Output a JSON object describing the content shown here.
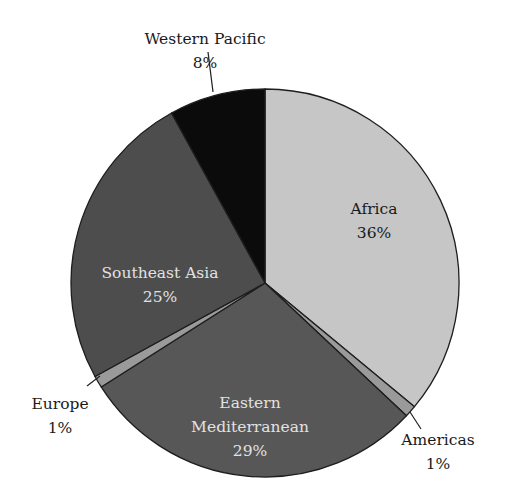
{
  "chart_data": {
    "type": "pie",
    "title": "",
    "start_angle_deg": 0,
    "direction": "clockwise",
    "slices": [
      {
        "label": "Africa",
        "value": 36,
        "pct_label": "36%",
        "color": "#c6c6c6",
        "label_color": "#1a1a1a",
        "label_pos": "inside"
      },
      {
        "label": "Americas",
        "value": 1,
        "pct_label": "1%",
        "color": "#9a9a9a",
        "label_color": "#1a1a1a",
        "label_pos": "outside"
      },
      {
        "label": "Eastern Mediterranean",
        "value": 29,
        "pct_label": "29%",
        "color": "#575757",
        "label_color": "#e2e2e2",
        "label_pos": "inside"
      },
      {
        "label": "Europe",
        "value": 1,
        "pct_label": "1%",
        "color": "#9a9a9a",
        "label_color": "#1a1a1a",
        "label_pos": "outside"
      },
      {
        "label": "Southeast Asia",
        "value": 25,
        "pct_label": "25%",
        "color": "#4d4d4d",
        "label_color": "#e2e2e2",
        "label_pos": "inside"
      },
      {
        "label": "Western Pacific",
        "value": 8,
        "pct_label": "8%",
        "color": "#0b0b0b",
        "label_color": "#1a1a1a",
        "label_pos": "outside"
      }
    ],
    "legend": "none"
  },
  "labels": {
    "africa": {
      "line1": "Africa",
      "line2": "36%"
    },
    "americas": {
      "line1": "Americas",
      "line2": "1%"
    },
    "eastern_mediterranean": {
      "line1": "Eastern",
      "line2": "Mediterranean",
      "line3": "29%"
    },
    "europe": {
      "line1": "Europe",
      "line2": "1%"
    },
    "southeast_asia": {
      "line1": "Southeast Asia",
      "line2": "25%"
    },
    "western_pacific": {
      "line1": "Western Pacific",
      "line2": "8%"
    }
  }
}
